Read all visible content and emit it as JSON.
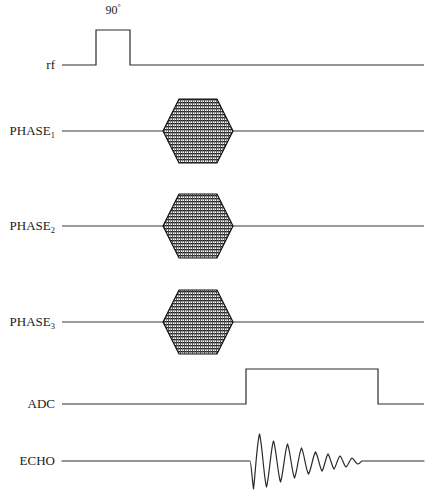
{
  "figure": {
    "type": "mri-pulse-sequence-diagram",
    "width": 436,
    "height": 495,
    "background_color": "#ffffff",
    "line_color": "#2b2b2b",
    "fill_color": "#808080"
  },
  "annotations": {
    "rf_flip_angle": "90",
    "rf_flip_angle_unit": "°"
  },
  "channels": [
    {
      "id": "rf",
      "label": "rf",
      "label_sub": "",
      "baseline_y": 65,
      "line_start_x": 62,
      "line_end_x": 424,
      "event": {
        "kind": "rect-pulse",
        "x_start": 96,
        "x_end": 130,
        "amplitude_y": 30
      }
    },
    {
      "id": "phase1",
      "label": "PHASE",
      "label_sub": "1",
      "baseline_y": 131,
      "line_start_x": 62,
      "line_end_x": 424,
      "event": {
        "kind": "hexagon-gradient",
        "x_start": 163,
        "x_end": 233,
        "half_height": 32,
        "bevel": 16
      }
    },
    {
      "id": "phase2",
      "label": "PHASE",
      "label_sub": "2",
      "baseline_y": 226,
      "line_start_x": 62,
      "line_end_x": 424,
      "event": {
        "kind": "hexagon-gradient",
        "x_start": 163,
        "x_end": 233,
        "half_height": 32,
        "bevel": 16
      }
    },
    {
      "id": "phase3",
      "label": "PHASE",
      "label_sub": "3",
      "baseline_y": 322,
      "line_start_x": 62,
      "line_end_x": 424,
      "event": {
        "kind": "hexagon-gradient",
        "x_start": 163,
        "x_end": 233,
        "half_height": 32,
        "bevel": 16
      }
    },
    {
      "id": "adc",
      "label": "ADC",
      "label_sub": "",
      "baseline_y": 404,
      "line_start_x": 62,
      "line_end_x": 424,
      "event": {
        "kind": "rect-window",
        "x_start": 246,
        "x_end": 378,
        "amplitude_y": 369
      }
    },
    {
      "id": "echo",
      "label": "ECHO",
      "label_sub": "",
      "baseline_y": 461,
      "line_start_x": 62,
      "line_end_x": 424,
      "event": {
        "kind": "damped-oscillation",
        "x_start": 252,
        "x_end": 362,
        "peak_amplitude": 28
      }
    }
  ]
}
